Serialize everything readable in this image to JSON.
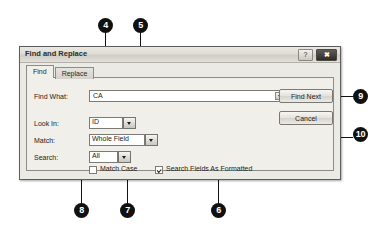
{
  "dialog": {
    "title": "Find and Replace",
    "titlebar_buttons": [
      {
        "name": "help-button",
        "glyph": "?"
      },
      {
        "name": "close-button",
        "glyph": "✖"
      }
    ],
    "tabs": [
      {
        "label": "Find",
        "active": true
      },
      {
        "label": "Replace",
        "active": false
      }
    ],
    "fields": {
      "find_what": {
        "label": "Find What:",
        "value": "CA"
      },
      "look_in": {
        "label": "Look In:",
        "value": "ID"
      },
      "match": {
        "label": "Match:",
        "value": "Whole Field"
      },
      "search": {
        "label": "Search:",
        "value": "All"
      }
    },
    "checkboxes": {
      "match_case": {
        "label": "Match Case",
        "checked": false
      },
      "search_fields_as_formatted": {
        "label": "Search Fields As Formatted",
        "checked": true
      }
    },
    "buttons": {
      "find_next": "Find Next",
      "cancel": "Cancel"
    }
  },
  "callouts": [
    {
      "id": "4",
      "number": "4"
    },
    {
      "id": "5",
      "number": "5"
    },
    {
      "id": "6",
      "number": "6"
    },
    {
      "id": "7",
      "number": "7"
    },
    {
      "id": "8",
      "number": "8"
    },
    {
      "id": "9",
      "number": "9"
    },
    {
      "id": "10",
      "number": "10"
    }
  ],
  "colors": {
    "callout_bg": "#111111",
    "callout_text": "#ffffff",
    "dialog_bg": "#eceae4",
    "panel_bg": "#f1efe9",
    "border": "#5d5d5d"
  }
}
